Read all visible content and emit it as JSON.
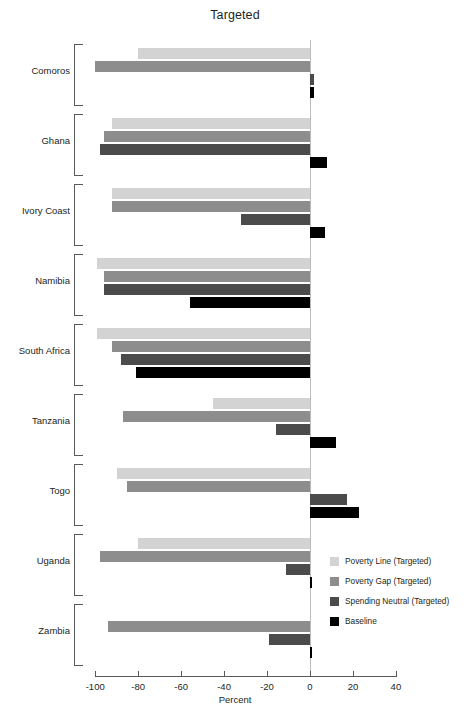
{
  "chart_data": {
    "type": "bar",
    "orientation": "horizontal",
    "title": "Targeted",
    "xlabel": "Percent",
    "ylabel": "",
    "xlim": [
      -100,
      40
    ],
    "xticks": [
      -100,
      -80,
      -60,
      -40,
      -20,
      0,
      20,
      40
    ],
    "xtick_labels": [
      "-100",
      "-80",
      "-60",
      "-40",
      "-20",
      "0",
      "20",
      "40"
    ],
    "grid": false,
    "legend_position": "right-inside",
    "zero_reference_line": true,
    "categories": [
      "Comoros",
      "Ghana",
      "Ivory Coast",
      "Namibia",
      "South Africa",
      "Tanzania",
      "Togo",
      "Uganda",
      "Zambia"
    ],
    "series": [
      {
        "name": "Poverty Line (Targeted)",
        "color": "#d3d3d3",
        "values": [
          -80,
          -92,
          -92,
          -99,
          -99,
          -45,
          -90,
          -80,
          0
        ]
      },
      {
        "name": "Poverty Gap (Targeted)",
        "color": "#8d8d8d",
        "values": [
          -100,
          -96,
          -92,
          -96,
          -92,
          -87,
          -85,
          -98,
          -94
        ]
      },
      {
        "name": "Spending Neutral (Targeted)",
        "color": "#4b4b4b",
        "values": [
          2,
          -98,
          -32,
          -96,
          -88,
          -16,
          17,
          -11,
          -19
        ]
      },
      {
        "name": "Baseline",
        "color": "#000000",
        "values": [
          2,
          8,
          7,
          -56,
          -81,
          12,
          23,
          1,
          1
        ]
      }
    ]
  },
  "legend": {
    "items": [
      {
        "label": "Poverty Line (Targeted)",
        "color": "#d3d3d3"
      },
      {
        "label": "Poverty Gap (Targeted)",
        "color": "#8d8d8d"
      },
      {
        "label": "Spending Neutral (Targeted)",
        "color": "#4b4b4b"
      },
      {
        "label": "Baseline",
        "color": "#000000"
      }
    ]
  },
  "colors": {
    "axis": "#58595b",
    "zero_line": "#bcbcbc",
    "text": "#231f20",
    "background": "#ffffff"
  }
}
